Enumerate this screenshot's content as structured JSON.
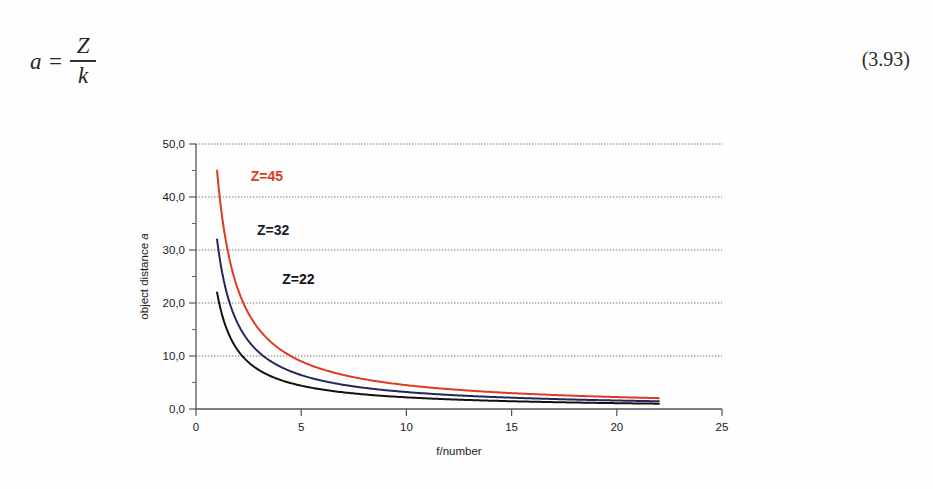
{
  "equation": {
    "variable": "a",
    "equals": "=",
    "numerator": "Z",
    "denominator": "k",
    "number": "(3.93)"
  },
  "chart_data": {
    "type": "line",
    "title": "",
    "xlabel": "f/number",
    "ylabel": "object distance a",
    "ylabel_plain": "object distance",
    "ylabel_italic": "a",
    "xlim": [
      0,
      25
    ],
    "ylim": [
      0,
      50
    ],
    "xticks": [
      0,
      5,
      10,
      15,
      20,
      25
    ],
    "xticklabels": [
      "0",
      "5",
      "10",
      "15",
      "20",
      "25"
    ],
    "yticks": [
      0,
      10,
      20,
      30,
      40,
      50
    ],
    "yticklabels": [
      "0,0",
      "10,0",
      "20,0",
      "30,0",
      "40,0",
      "50,0"
    ],
    "yminorticks": [
      5,
      15,
      25,
      35,
      45
    ],
    "grid": "horizontal-dotted",
    "legend": "inline-labels",
    "x": [
      1,
      1.5,
      2,
      2.5,
      3,
      3.5,
      4,
      4.5,
      5,
      6,
      7,
      8,
      9,
      10,
      11,
      12,
      13,
      14,
      15,
      16,
      17,
      18,
      19,
      20,
      21,
      22
    ],
    "series": [
      {
        "name": "Z=45",
        "label": "Z=45",
        "color": "#dd3b22",
        "Z": 45,
        "label_x": 2.6,
        "label_y": 43.0,
        "values": [
          45,
          30,
          22.5,
          18,
          15,
          12.86,
          11.25,
          10,
          9,
          7.5,
          6.43,
          5.63,
          5,
          4.5,
          4.09,
          3.75,
          3.46,
          3.21,
          3,
          2.81,
          2.65,
          2.5,
          2.37,
          2.25,
          2.14,
          2.05
        ]
      },
      {
        "name": "Z=32",
        "label": "Z=32",
        "color": "#23275c",
        "Z": 32,
        "label_x": 2.9,
        "label_y": 32.8,
        "values": [
          32,
          21.33,
          16,
          12.8,
          10.67,
          9.14,
          8,
          7.11,
          6.4,
          5.33,
          4.57,
          4,
          3.56,
          3.2,
          2.91,
          2.67,
          2.46,
          2.29,
          2.13,
          2,
          1.88,
          1.78,
          1.68,
          1.6,
          1.52,
          1.45
        ]
      },
      {
        "name": "Z=22",
        "label": "Z=22",
        "color": "#121212",
        "Z": 22,
        "label_x": 4.1,
        "label_y": 23.6,
        "values": [
          22,
          14.67,
          11,
          8.8,
          7.33,
          6.29,
          5.5,
          4.89,
          4.4,
          3.67,
          3.14,
          2.75,
          2.44,
          2.2,
          2,
          1.83,
          1.69,
          1.57,
          1.47,
          1.38,
          1.29,
          1.22,
          1.16,
          1.1,
          1.05,
          1
        ]
      }
    ],
    "series_label_colors": {
      "Z=45": "#dd3b22",
      "Z=32": "#1c1c2e",
      "Z=22": "#121212"
    }
  }
}
